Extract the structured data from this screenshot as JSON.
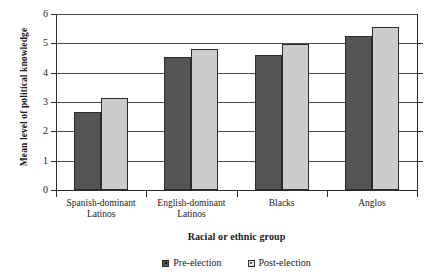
{
  "chart_data": {
    "type": "bar",
    "title": "",
    "xlabel": "Racial or ethnic group",
    "ylabel": "Mean level of political knowledge",
    "categories": [
      "Spanish-dominant\nLatinos",
      "English-dominant\nLatinos",
      "Blacks",
      "Anglos"
    ],
    "series": [
      {
        "name": "Pre-election",
        "color": "#555555",
        "values": [
          2.65,
          4.55,
          4.6,
          5.25
        ]
      },
      {
        "name": "Post-election",
        "color": "#cccccc",
        "values": [
          3.15,
          4.8,
          4.97,
          5.55
        ]
      }
    ],
    "ylim": [
      0,
      6
    ],
    "yticks": [
      "0",
      "1",
      "2",
      "3",
      "4",
      "5",
      "6"
    ],
    "grid": true,
    "legend_position": "bottom"
  }
}
